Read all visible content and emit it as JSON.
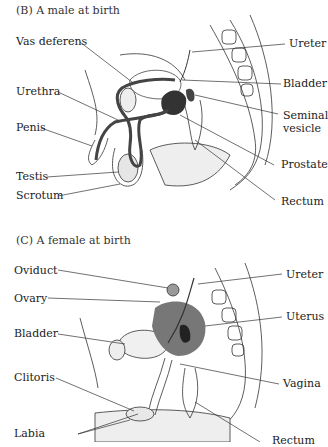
{
  "panels": [
    {
      "id": "B",
      "title": "(B)  A male at birth",
      "labels": {
        "vas_deferens": "Vas deferens",
        "urethra": "Urethra",
        "penis": "Penis",
        "testis": "Testis",
        "scrotum": "Scrotum",
        "ureter": "Ureter",
        "bladder": "Bladder",
        "seminal_vesicle_1": "Seminal",
        "seminal_vesicle_2": "vesicle",
        "prostate": "Prostate",
        "rectum": "Rectum"
      }
    },
    {
      "id": "C",
      "title": "(C)  A female at birth",
      "labels": {
        "oviduct": "Oviduct",
        "ovary": "Ovary",
        "bladder": "Bladder",
        "clitoris": "Clitoris",
        "labia": "Labia",
        "ureter": "Ureter",
        "uterus": "Uterus",
        "vagina": "Vagina",
        "rectum": "Rectum"
      }
    }
  ]
}
